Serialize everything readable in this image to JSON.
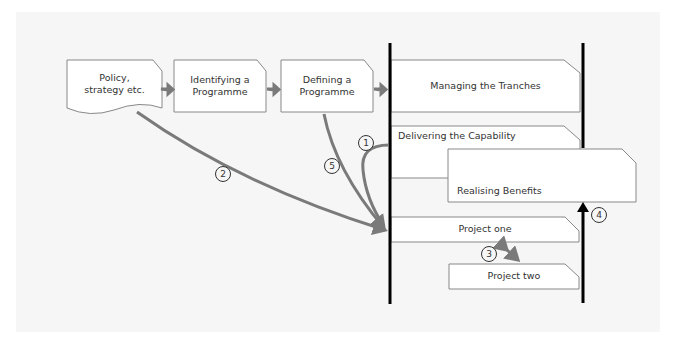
{
  "diagram": {
    "boxes": {
      "policy": "Policy, strategy etc.",
      "policy_line1": "Policy,",
      "policy_line2": "strategy etc.",
      "identifying_line1": "Identifying a",
      "identifying_line2": "Programme",
      "defining_line1": "Defining a",
      "defining_line2": "Programme",
      "managing": "Managing the Tranches",
      "delivering": "Delivering the Capability",
      "realising": "Realising Benefits",
      "project_one": "Project one",
      "project_two": "Project two"
    },
    "markers": [
      "1",
      "2",
      "3",
      "4",
      "5"
    ],
    "colors": {
      "arrow": "#7a7a7a",
      "timeline": "#000000",
      "box_border": "#888888",
      "background": "#f6f6f6"
    }
  }
}
